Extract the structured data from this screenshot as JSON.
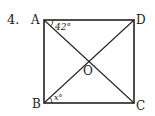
{
  "problem": {
    "number": "4.",
    "figure": "square",
    "vertices": {
      "A": {
        "label": "A",
        "x": 44,
        "y": 20
      },
      "D": {
        "label": "D",
        "x": 134,
        "y": 20
      },
      "B": {
        "label": "B",
        "x": 44,
        "y": 103
      },
      "C": {
        "label": "C",
        "x": 134,
        "y": 103
      }
    },
    "center": {
      "label": "O"
    },
    "angles": {
      "at_A": "42°",
      "at_B": "x°"
    },
    "colors": {
      "stroke": "#222222",
      "background": "#ffffff"
    }
  }
}
